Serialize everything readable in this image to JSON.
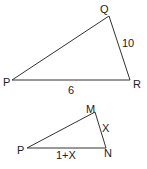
{
  "diagram": {
    "triangle_large": {
      "vertices": [
        {
          "label": "Q",
          "x": 109,
          "y": 16,
          "lx": 100,
          "ly": 13
        },
        {
          "label": "P",
          "x": 12,
          "y": 80,
          "lx": 3,
          "ly": 86
        },
        {
          "label": "R",
          "x": 130,
          "y": 80,
          "lx": 133,
          "ly": 88
        }
      ],
      "sides": [
        {
          "label": "10",
          "between": "Q-R",
          "lx": 122,
          "ly": 47
        },
        {
          "label": "6",
          "between": "P-R",
          "lx": 68,
          "ly": 94
        }
      ]
    },
    "triangle_small": {
      "vertices": [
        {
          "label": "M",
          "x": 95,
          "y": 112,
          "lx": 86,
          "ly": 113
        },
        {
          "label": "P",
          "x": 27,
          "y": 148,
          "lx": 17,
          "ly": 154
        },
        {
          "label": "N",
          "x": 106,
          "y": 148,
          "lx": 104,
          "ly": 157
        }
      ],
      "sides": [
        {
          "label": "X",
          "between": "M-N",
          "lx": 102,
          "ly": 132
        },
        {
          "label": "1+X",
          "between": "P-N",
          "lx": 56,
          "ly": 159
        }
      ]
    }
  }
}
